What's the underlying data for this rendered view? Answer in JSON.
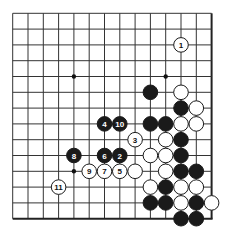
{
  "diagram": {
    "type": "go-board-partial",
    "grid": {
      "columns": 14,
      "rows": 14,
      "x0": 12.7,
      "y0": 13.3,
      "dx": 15.3,
      "dy": 15.8,
      "thick_edges": [
        "right",
        "bottom"
      ]
    },
    "colors": {
      "line": "#333333",
      "edge": "#222222",
      "black_stone": "#1a1a1a",
      "white_stone": "#ffffff",
      "star": "#111111"
    },
    "star_points": [
      {
        "col": 4,
        "row": 4
      },
      {
        "col": 10,
        "row": 4
      },
      {
        "col": 4,
        "row": 10
      }
    ],
    "stones": [
      {
        "color": "black",
        "col": 9,
        "row": 5,
        "label": ""
      },
      {
        "color": "black",
        "col": 11,
        "row": 6,
        "label": ""
      },
      {
        "color": "black",
        "col": 9,
        "row": 7,
        "label": ""
      },
      {
        "color": "black",
        "col": 10,
        "row": 7,
        "label": ""
      },
      {
        "color": "black",
        "col": 11,
        "row": 8,
        "label": ""
      },
      {
        "color": "black",
        "col": 11,
        "row": 9,
        "label": ""
      },
      {
        "color": "black",
        "col": 11,
        "row": 10,
        "label": ""
      },
      {
        "color": "black",
        "col": 12,
        "row": 10,
        "label": ""
      },
      {
        "color": "black",
        "col": 10,
        "row": 11,
        "label": ""
      },
      {
        "color": "black",
        "col": 9,
        "row": 12,
        "label": ""
      },
      {
        "color": "black",
        "col": 10,
        "row": 12,
        "label": ""
      },
      {
        "color": "black",
        "col": 12,
        "row": 12,
        "label": ""
      },
      {
        "color": "black",
        "col": 11,
        "row": 13,
        "label": ""
      },
      {
        "color": "black",
        "col": 12,
        "row": 13,
        "label": ""
      },
      {
        "color": "white",
        "col": 11,
        "row": 5,
        "label": ""
      },
      {
        "color": "white",
        "col": 12,
        "row": 6,
        "label": ""
      },
      {
        "color": "white",
        "col": 11,
        "row": 7,
        "label": ""
      },
      {
        "color": "white",
        "col": 12,
        "row": 7,
        "label": ""
      },
      {
        "color": "white",
        "col": 10,
        "row": 8,
        "label": ""
      },
      {
        "color": "white",
        "col": 9,
        "row": 9,
        "label": ""
      },
      {
        "color": "white",
        "col": 10,
        "row": 9,
        "label": ""
      },
      {
        "color": "white",
        "col": 8,
        "row": 10,
        "label": ""
      },
      {
        "color": "white",
        "col": 10,
        "row": 10,
        "label": ""
      },
      {
        "color": "white",
        "col": 9,
        "row": 11,
        "label": ""
      },
      {
        "color": "white",
        "col": 11,
        "row": 11,
        "label": ""
      },
      {
        "color": "white",
        "col": 12,
        "row": 11,
        "label": ""
      },
      {
        "color": "white",
        "col": 11,
        "row": 12,
        "label": ""
      },
      {
        "color": "white",
        "col": 13,
        "row": 12,
        "label": ""
      },
      {
        "color": "white",
        "col": 11,
        "row": 2,
        "label": "1"
      },
      {
        "color": "black",
        "col": 7,
        "row": 9,
        "label": "2"
      },
      {
        "color": "white",
        "col": 8,
        "row": 8,
        "label": "3"
      },
      {
        "color": "black",
        "col": 6,
        "row": 7,
        "label": "4"
      },
      {
        "color": "white",
        "col": 7,
        "row": 10,
        "label": "5"
      },
      {
        "color": "black",
        "col": 6,
        "row": 9,
        "label": "6"
      },
      {
        "color": "white",
        "col": 6,
        "row": 10,
        "label": "7"
      },
      {
        "color": "black",
        "col": 4,
        "row": 9,
        "label": "8"
      },
      {
        "color": "white",
        "col": 5,
        "row": 10,
        "label": "9"
      },
      {
        "color": "black",
        "col": 7,
        "row": 7,
        "label": "10"
      },
      {
        "color": "white",
        "col": 3,
        "row": 11,
        "label": "11"
      }
    ]
  }
}
